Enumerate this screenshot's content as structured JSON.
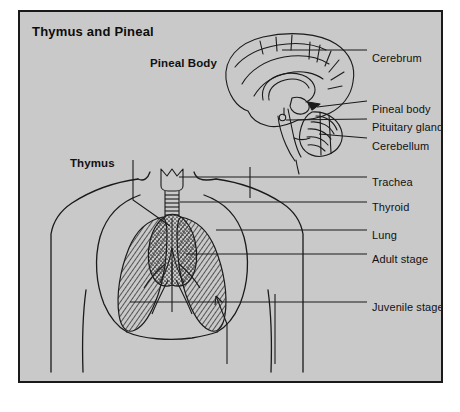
{
  "panel": {
    "title": "Thymus and Pineal",
    "background_color": "#c9c9c9",
    "border_color": "#1a1a1a",
    "ink_color": "#111111"
  },
  "inner_labels": [
    {
      "name": "pineal-body",
      "text": "Pineal Body",
      "x": 148,
      "y": 52,
      "bold": true
    },
    {
      "name": "thymus",
      "text": "Thymus",
      "x": 68,
      "y": 152,
      "bold": true
    }
  ],
  "callout_labels": [
    {
      "name": "cerebrum",
      "text": "Cerebrum",
      "x": 370,
      "y": 48
    },
    {
      "name": "pineal-body",
      "text": "Pineal body",
      "x": 370,
      "y": 99
    },
    {
      "name": "pituitary-gland",
      "text": "Pituitary gland",
      "x": 370,
      "y": 117
    },
    {
      "name": "cerebellum",
      "text": "Cerebellum",
      "x": 370,
      "y": 136
    },
    {
      "name": "trachea",
      "text": "Trachea",
      "x": 370,
      "y": 172
    },
    {
      "name": "thyroid",
      "text": "Thyroid",
      "x": 370,
      "y": 197
    },
    {
      "name": "lung",
      "text": "Lung",
      "x": 370,
      "y": 225
    },
    {
      "name": "adult-stage",
      "text": "Adult stage",
      "x": 370,
      "y": 249
    },
    {
      "name": "juvenile-stage",
      "text": "Juvenile stage",
      "x": 370,
      "y": 297
    }
  ],
  "figure_parts": [
    "brain-sagittal-section",
    "larynx",
    "trachea",
    "thymus-stippled",
    "lungs-hatched",
    "torso-outline"
  ]
}
